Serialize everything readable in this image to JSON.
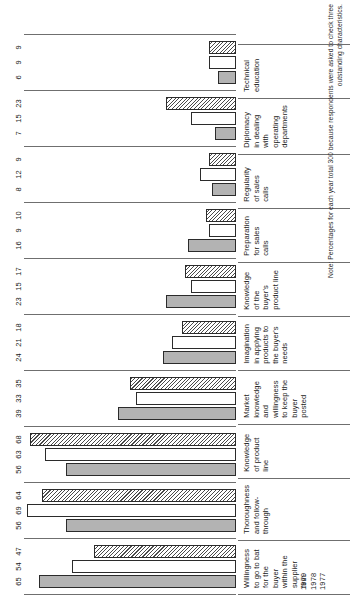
{
  "legend": {
    "entries": [
      {
        "year": "1979",
        "style": "solid-gray"
      },
      {
        "year": "1978",
        "style": "hollow-white"
      },
      {
        "year": "1977",
        "style": "diagonal-hatch"
      }
    ]
  },
  "note": {
    "text": "Note: Percentages for each year total 300 because respondents were asked to check three outstanding characteristics."
  },
  "chart_data": {
    "type": "bar",
    "title": "",
    "xlabel": "",
    "ylabel": "",
    "ylim": [
      0,
      70
    ],
    "grid": false,
    "legend_position": "top-left",
    "orientation": "vertical-grouped-rotated",
    "categories": [
      "Willingness to go to bat for the buyer within the supplier firm",
      "Thoroughness and follow-through",
      "Knowledge of product line",
      "Market knowledge and willingness to keep the buyer posted",
      "Imagination in applying products to the buyer's needs",
      "Knowledge of the buyer's product line",
      "Preparation for sales calls",
      "Regularity of sales calls",
      "Diplomacy in dealing with operating departments",
      "Technical education"
    ],
    "series": [
      {
        "name": "1979",
        "values": [
          65,
          56,
          56,
          39,
          24,
          23,
          16,
          8,
          7,
          6
        ]
      },
      {
        "name": "1978",
        "values": [
          54,
          69,
          63,
          33,
          21,
          15,
          9,
          12,
          15,
          9
        ]
      },
      {
        "name": "1977",
        "values": [
          47,
          64,
          68,
          35,
          18,
          17,
          10,
          9,
          23,
          9
        ]
      }
    ]
  }
}
